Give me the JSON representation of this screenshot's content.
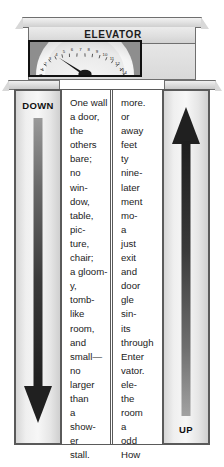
{
  "scene": {
    "title": "ELEVATOR",
    "description": "Grayscale illustration of an elevator storefront facade with floor-indicator dial and two columns of poem text"
  },
  "sign": {
    "elevator_label": "ELEVATOR"
  },
  "gauge": {
    "name": "floor-indicator-dial",
    "ticks": [
      "1",
      "2",
      "3",
      "4",
      "5",
      "6",
      "7",
      "8",
      "9",
      "10",
      "11",
      "12",
      "13",
      "14"
    ],
    "min": 1,
    "max": 14,
    "needle_value": 4,
    "face_color": "#f2f2f2",
    "bezel_color": "#8e8e8e",
    "needle_color": "#151515"
  },
  "shafts": {
    "down": {
      "label": "DOWN",
      "direction": "down",
      "arrow_color": "#2b2b2b"
    },
    "up": {
      "label": "UP",
      "direction": "up",
      "arrow_color": "#2b2b2b"
    }
  },
  "columns": {
    "left": {
      "name": "poem-column-left",
      "lines": [
        "One wall",
        "a door,",
        "the",
        "others",
        "bare;",
        "no",
        "win-",
        "dow,",
        "table,",
        "pic-",
        "ture,",
        "chair;",
        "a gloom-",
        "y,",
        "tomb-",
        "like",
        "room,",
        "and",
        "small—",
        "no",
        "larger",
        "than",
        "a",
        "show-",
        "er",
        "stall."
      ]
    },
    "right": {
      "name": "poem-column-right",
      "lines": [
        "more.",
        "or",
        "away",
        "feet",
        "ty",
        "nine-",
        "later",
        "ment",
        "mo-",
        "a",
        "just",
        "exit",
        "and",
        "door",
        "gle",
        "sin-",
        "its",
        "through",
        "Enter",
        "vator.",
        "ele-",
        "the",
        "room",
        "a",
        "odd",
        "How"
      ]
    }
  },
  "colors": {
    "ink": "#1b1b1b",
    "frame": "#5a5a5a",
    "stone_light": "#f0f0f0",
    "stone_mid": "#dcdcdc",
    "stone_dark": "#c9c9c9",
    "page": "#ffffff"
  }
}
